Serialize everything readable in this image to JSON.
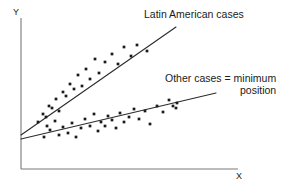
{
  "chart_data": {
    "type": "scatter",
    "title": "",
    "xlabel": "X",
    "ylabel": "Y",
    "grid": false,
    "legend_position": "inline-annotation",
    "xlim": [
      0,
      100
    ],
    "ylim": [
      0,
      100
    ],
    "axis_ticks": {
      "x": [],
      "y": []
    },
    "annotations": [
      {
        "name": "latin-american-cases-label",
        "text": "Latin American cases",
        "x": 144,
        "y": 8
      },
      {
        "name": "other-cases-label",
        "text_line1": "Other cases = minimum",
        "text_line2": "position",
        "x": 165,
        "y": 72
      }
    ],
    "series": [
      {
        "name": "Latin American cases",
        "marker": "filled-square-dot",
        "color": "#1a1a1a",
        "fit_line": {
          "x1": 21,
          "y1": 135,
          "x2": 176,
          "y2": 27
        },
        "points": [
          [
            38,
            122
          ],
          [
            43,
            114
          ],
          [
            46,
            117
          ],
          [
            49,
            106
          ],
          [
            52,
            108
          ],
          [
            56,
            99
          ],
          [
            59,
            111
          ],
          [
            63,
            92
          ],
          [
            66,
            96
          ],
          [
            70,
            84
          ],
          [
            74,
            89
          ],
          [
            78,
            75
          ],
          [
            82,
            86
          ],
          [
            86,
            69
          ],
          [
            90,
            79
          ],
          [
            95,
            59
          ],
          [
            99,
            73
          ],
          [
            105,
            62
          ],
          [
            112,
            54
          ],
          [
            118,
            64
          ],
          [
            124,
            47
          ],
          [
            131,
            56
          ],
          [
            137,
            45
          ],
          [
            147,
            51
          ]
        ]
      },
      {
        "name": "Other cases = minimum position",
        "marker": "filled-square-dot",
        "color": "#1a1a1a",
        "fit_line": {
          "x1": 21,
          "y1": 139,
          "x2": 216,
          "y2": 93
        },
        "points": [
          [
            44,
            137
          ],
          [
            47,
            126
          ],
          [
            50,
            130
          ],
          [
            55,
            121
          ],
          [
            59,
            135
          ],
          [
            63,
            127
          ],
          [
            68,
            133
          ],
          [
            72,
            123
          ],
          [
            76,
            137
          ],
          [
            81,
            128
          ],
          [
            85,
            119
          ],
          [
            90,
            126
          ],
          [
            94,
            114
          ],
          [
            98,
            131
          ],
          [
            101,
            122
          ],
          [
            105,
            126
          ],
          [
            108,
            116
          ],
          [
            112,
            120
          ],
          [
            116,
            128
          ],
          [
            120,
            113
          ],
          [
            124,
            122
          ],
          [
            129,
            117
          ],
          [
            134,
            109
          ],
          [
            139,
            119
          ],
          [
            145,
            111
          ],
          [
            150,
            124
          ],
          [
            157,
            106
          ],
          [
            163,
            112
          ],
          [
            169,
            100
          ],
          [
            173,
            106
          ],
          [
            176,
            108
          ],
          [
            177,
            103
          ]
        ]
      }
    ]
  },
  "axes": {
    "y_label": "Y",
    "x_label": "X",
    "color": "#6e6e6e",
    "origin": {
      "x": 21,
      "y": 169
    },
    "y_top": 18,
    "x_right": 238
  },
  "style": {
    "background": "#ffffff",
    "ink": "#1a1a1a",
    "line_color": "#2b2b2b",
    "axis_color": "#777777"
  }
}
